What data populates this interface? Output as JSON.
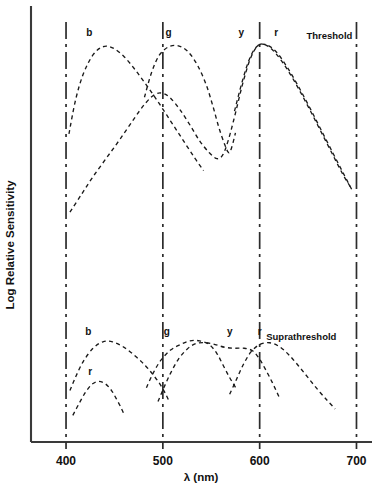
{
  "figure": {
    "title": "",
    "y_axis_title": "Log Relative Sensitivity",
    "x_axis_title": "λ (nm)"
  },
  "chart_data": {
    "type": "line",
    "title": "",
    "xlabel": "λ (nm)",
    "ylabel": "Log Relative Sensitivity",
    "xlim": [
      370,
      715
    ],
    "ylim": [
      0,
      10
    ],
    "grid": true,
    "gridlines_x": [
      400,
      500,
      600,
      700
    ],
    "xticks": [
      400,
      500,
      600,
      700
    ],
    "xtick_labels": [
      "400",
      "500",
      "600",
      "700"
    ],
    "yticks": [],
    "ytick_labels": [],
    "legend_position": "inline-annotations",
    "panels": [
      {
        "name": "Threshold",
        "label": "Threshold",
        "label_x": 672,
        "label_y": 9.35,
        "series": [
          {
            "name": "b",
            "label": "b",
            "label_x": 424,
            "label_y": 9.5,
            "peak_nm": 440,
            "points": [
              [
                403,
                4.55
              ],
              [
                410,
                6.3
              ],
              [
                418,
                7.6
              ],
              [
                428,
                8.55
              ],
              [
                438,
                8.95
              ],
              [
                448,
                8.9
              ],
              [
                460,
                8.45
              ],
              [
                472,
                7.75
              ],
              [
                484,
                6.95
              ],
              [
                496,
                6.1
              ],
              [
                508,
                5.2
              ],
              [
                520,
                4.3
              ],
              [
                532,
                3.4
              ],
              [
                542,
                2.7
              ]
            ]
          },
          {
            "name": "y",
            "label": "y",
            "label_x": 581,
            "label_y": 9.5,
            "peak_nm": 597,
            "points": [
              [
                404,
                0.6
              ],
              [
                416,
                1.5
              ],
              [
                428,
                2.4
              ],
              [
                442,
                3.35
              ],
              [
                456,
                4.3
              ],
              [
                470,
                5.3
              ],
              [
                482,
                6.1
              ],
              [
                492,
                6.55
              ],
              [
                500,
                6.6
              ],
              [
                508,
                6.35
              ],
              [
                518,
                5.75
              ],
              [
                528,
                5.0
              ],
              [
                538,
                4.2
              ],
              [
                548,
                3.6
              ],
              [
                556,
                3.3
              ],
              [
                562,
                3.5
              ],
              [
                568,
                4.3
              ],
              [
                575,
                5.6
              ],
              [
                582,
                7.0
              ],
              [
                590,
                8.3
              ],
              [
                598,
                9.0
              ],
              [
                606,
                9.05
              ],
              [
                616,
                8.65
              ],
              [
                628,
                7.85
              ],
              [
                640,
                6.85
              ],
              [
                652,
                5.75
              ],
              [
                664,
                4.6
              ],
              [
                676,
                3.45
              ],
              [
                686,
                2.5
              ],
              [
                694,
                1.85
              ]
            ]
          },
          {
            "name": "g",
            "label": "g",
            "label_x": 506,
            "label_y": 9.5,
            "peak_nm": 512,
            "points": [
              [
                481,
                6.4
              ],
              [
                488,
                7.6
              ],
              [
                496,
                8.5
              ],
              [
                506,
                8.95
              ],
              [
                516,
                9.0
              ],
              [
                526,
                8.7
              ],
              [
                536,
                8.0
              ],
              [
                545,
                7.0
              ],
              [
                552,
                5.9
              ],
              [
                558,
                4.85
              ],
              [
                564,
                4.0
              ],
              [
                568,
                3.6
              ],
              [
                571,
                3.85
              ],
              [
                575,
                4.6
              ]
            ]
          },
          {
            "name": "r",
            "label": "r",
            "label_x": 617,
            "label_y": 9.5,
            "peak_nm": 604,
            "points": [
              [
                574,
                5.7
              ],
              [
                582,
                7.2
              ],
              [
                590,
                8.4
              ],
              [
                598,
                9.0
              ],
              [
                607,
                9.05
              ],
              [
                617,
                8.7
              ],
              [
                628,
                7.95
              ],
              [
                640,
                6.95
              ],
              [
                652,
                5.85
              ],
              [
                664,
                4.7
              ],
              [
                676,
                3.55
              ],
              [
                686,
                2.6
              ],
              [
                695,
                1.75
              ]
            ]
          }
        ]
      },
      {
        "name": "Suprathreshold",
        "label": "Suprathreshold",
        "label_x": 643,
        "label_y": 4.35,
        "series": [
          {
            "name": "b",
            "label": "b",
            "label_x": 423,
            "label_y": 4.6,
            "peak_nm": 437,
            "points": [
              [
                404,
                1.6
              ],
              [
                410,
                2.35
              ],
              [
                418,
                3.2
              ],
              [
                428,
                3.9
              ],
              [
                438,
                4.25
              ],
              [
                448,
                4.25
              ],
              [
                460,
                3.95
              ],
              [
                472,
                3.45
              ],
              [
                482,
                2.95
              ],
              [
                490,
                2.45
              ],
              [
                497,
                1.95
              ],
              [
                503,
                1.4
              ],
              [
                507,
                0.95
              ]
            ]
          },
          {
            "name": "g",
            "label": "g",
            "label_x": 504,
            "label_y": 4.6,
            "peak_nm": 538,
            "points": [
              [
                483,
                1.75
              ],
              [
                490,
                2.55
              ],
              [
                498,
                3.25
              ],
              [
                508,
                3.8
              ],
              [
                518,
                4.1
              ],
              [
                528,
                4.3
              ],
              [
                538,
                4.3
              ],
              [
                548,
                4.1
              ],
              [
                556,
                3.6
              ],
              [
                562,
                3.0
              ],
              [
                568,
                2.4
              ],
              [
                573,
                1.95
              ],
              [
                576,
                1.7
              ]
            ]
          },
          {
            "name": "y",
            "label": "y",
            "label_x": 569,
            "label_y": 4.6,
            "peak_nm": 540,
            "points": [
              [
                495,
                1.0
              ],
              [
                501,
                1.75
              ],
              [
                508,
                2.55
              ],
              [
                516,
                3.3
              ],
              [
                525,
                3.85
              ],
              [
                534,
                4.15
              ],
              [
                544,
                4.2
              ],
              [
                554,
                4.1
              ],
              [
                564,
                3.95
              ],
              [
                574,
                3.9
              ],
              [
                584,
                3.9
              ],
              [
                593,
                3.75
              ],
              [
                600,
                3.3
              ],
              [
                606,
                2.75
              ],
              [
                612,
                2.15
              ],
              [
                617,
                1.6
              ],
              [
                620,
                1.25
              ]
            ]
          },
          {
            "name": "r",
            "label": "r",
            "label_x": 600,
            "label_y": 4.6,
            "peak_nm": 607,
            "points": [
              [
                569,
                1.4
              ],
              [
                576,
                2.2
              ],
              [
                583,
                3.0
              ],
              [
                591,
                3.7
              ],
              [
                600,
                4.1
              ],
              [
                610,
                4.2
              ],
              [
                620,
                4.0
              ],
              [
                630,
                3.55
              ],
              [
                640,
                2.95
              ],
              [
                650,
                2.3
              ],
              [
                660,
                1.65
              ],
              [
                670,
                1.05
              ],
              [
                678,
                0.6
              ]
            ]
          },
          {
            "name": "r-short",
            "label": "r",
            "label_x": 425,
            "label_y": 2.45,
            "peak_nm": 430,
            "points": [
              [
                407,
                0.25
              ],
              [
                413,
                0.85
              ],
              [
                420,
                1.5
              ],
              [
                427,
                1.95
              ],
              [
                434,
                2.1
              ],
              [
                441,
                1.95
              ],
              [
                447,
                1.6
              ],
              [
                452,
                1.15
              ],
              [
                457,
                0.65
              ],
              [
                460,
                0.3
              ]
            ]
          }
        ]
      }
    ]
  }
}
